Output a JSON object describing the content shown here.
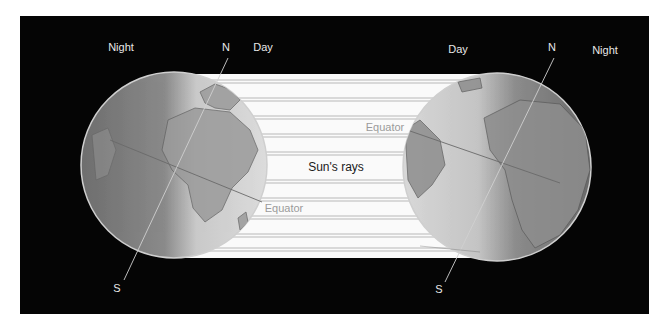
{
  "diagram": {
    "background_color": "#ffffff",
    "panel_color": "#050505",
    "rays": {
      "label": "Sun's rays",
      "band_color": "#fafafa",
      "stripe_color": "#b8b8b8",
      "stripe_count": 10
    },
    "left_globe": {
      "labels": {
        "night": "Night",
        "north": "N",
        "day": "Day",
        "south": "S",
        "equator": "Equator"
      }
    },
    "right_globe": {
      "labels": {
        "day": "Day",
        "north": "N",
        "night": "Night",
        "south": "S",
        "equator": "Equator"
      }
    }
  }
}
